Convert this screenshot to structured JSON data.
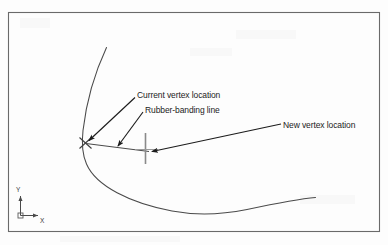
{
  "figure": {
    "type": "cad-diagram",
    "background_color": "#fdfdfd",
    "line_color": "#3c3c3c",
    "text_color": "#1c1c1c",
    "border": {
      "x": 8,
      "y": 12,
      "width": 372,
      "height": 220,
      "color": "#6a6a6a"
    },
    "annotations": [
      {
        "id": "current-vertex",
        "label": "Current vertex location",
        "text_x": 137,
        "text_y": 90,
        "leader_from": [
          135,
          98
        ],
        "leader_to": [
          88,
          141
        ]
      },
      {
        "id": "rubber-banding",
        "label": "Rubber-banding line",
        "text_x": 145,
        "text_y": 105,
        "leader_from": [
          143,
          112
        ],
        "leader_to": [
          117,
          147
        ]
      },
      {
        "id": "new-vertex",
        "label": "New vertex location",
        "text_x": 283,
        "text_y": 120,
        "leader_from": [
          281,
          124
        ],
        "leader_to": [
          150,
          152
        ]
      }
    ],
    "geometry": {
      "spline_label": "polyline-spline-curve",
      "vertex_marker": {
        "label": "current-vertex-x-marker",
        "x": 85,
        "y": 143,
        "size": 7
      },
      "crosshair_cursor": {
        "label": "crosshair-cursor",
        "x": 145,
        "y": 148,
        "v_top": 133,
        "v_bottom": 164
      },
      "rubber_band_line": {
        "label": "rubber-banding-line",
        "from": [
          86,
          143
        ],
        "to": [
          148,
          151
        ]
      }
    },
    "ucs_icon": {
      "label": "ucs-axis-icon",
      "origin_x": 20,
      "origin_y": 215,
      "y_axis_label": "Y",
      "x_axis_label": "X"
    }
  }
}
